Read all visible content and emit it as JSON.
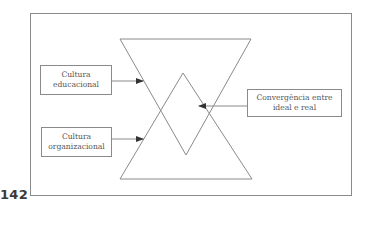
{
  "figure": {
    "boxes": [
      {
        "id": "cultura-educacional",
        "lines": [
          "Cultura",
          "educacional"
        ]
      },
      {
        "id": "cultura-organizacional",
        "lines": [
          "Cultura",
          "organizacional"
        ]
      },
      {
        "id": "convergencia",
        "lines": [
          "Convergência entre",
          "ideal e real"
        ]
      }
    ],
    "shapes": {
      "top_triangle": "inverted triangle",
      "bottom_triangle": "upright triangle",
      "overlap": "diamond"
    },
    "colors": {
      "line": "#8a8a8a",
      "arrow": "#333333",
      "text": "#555555"
    }
  },
  "page": {
    "number": "142"
  }
}
